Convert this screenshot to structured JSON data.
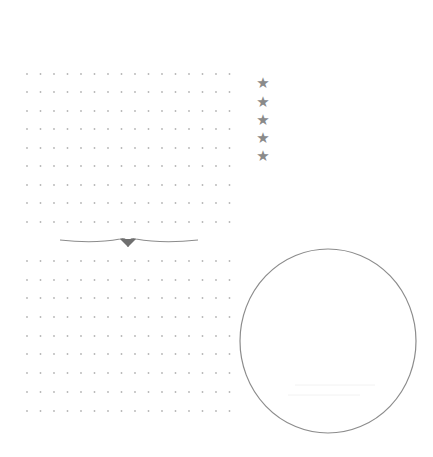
{
  "page": {
    "background": "#ffffff",
    "dot_color": "#b5b5b5",
    "line_color": "#8c8c8c"
  },
  "dot_grids": [
    {
      "name": "upper-dot-grid",
      "x0": 27,
      "dx": 13.5,
      "cols": 16,
      "rows_y": [
        74,
        92,
        111,
        129,
        148,
        166,
        185,
        203,
        222
      ]
    },
    {
      "name": "lower-dot-grid",
      "x0": 27,
      "dx": 13.5,
      "cols": 16,
      "rows_y": [
        261,
        280,
        298,
        317,
        336,
        354,
        373,
        392,
        411
      ]
    }
  ],
  "divider": {
    "name": "ornament-divider",
    "x_start": 60,
    "x_end": 198,
    "y": 240,
    "point_x": 128,
    "point_y": 247
  },
  "rating": {
    "glyph": "★",
    "count": 5,
    "x": 256,
    "ys": [
      76,
      95,
      113,
      131,
      149
    ],
    "color": "#8a8a8a"
  },
  "circle": {
    "cx": 328,
    "cy": 341,
    "rx": 88,
    "ry": 92,
    "stroke": "#8c8c8c",
    "faint_lines": [
      {
        "x1": 295,
        "x2": 375,
        "y": 385
      },
      {
        "x1": 288,
        "x2": 360,
        "y": 395
      }
    ]
  }
}
